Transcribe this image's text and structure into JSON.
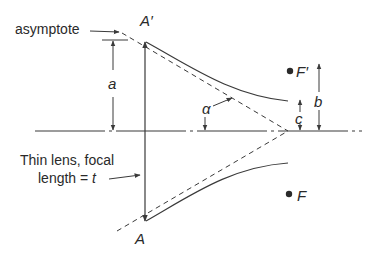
{
  "diagram": {
    "type": "optics-hyperbolic-lens-geometry",
    "colors": {
      "line": "#3a3a3a",
      "text": "#2a2a2a",
      "background": "#ffffff"
    },
    "labels": {
      "asymptote": "asymptote",
      "a_prime": "A′",
      "a": "A",
      "dim_a": "a",
      "dim_b": "b",
      "dim_c": "c",
      "alpha": "α",
      "f_prime": "F′",
      "f": "F",
      "lens_line1": "Thin lens, focal",
      "lens_line2_prefix": "length = ",
      "lens_line2_var": "t"
    }
  }
}
